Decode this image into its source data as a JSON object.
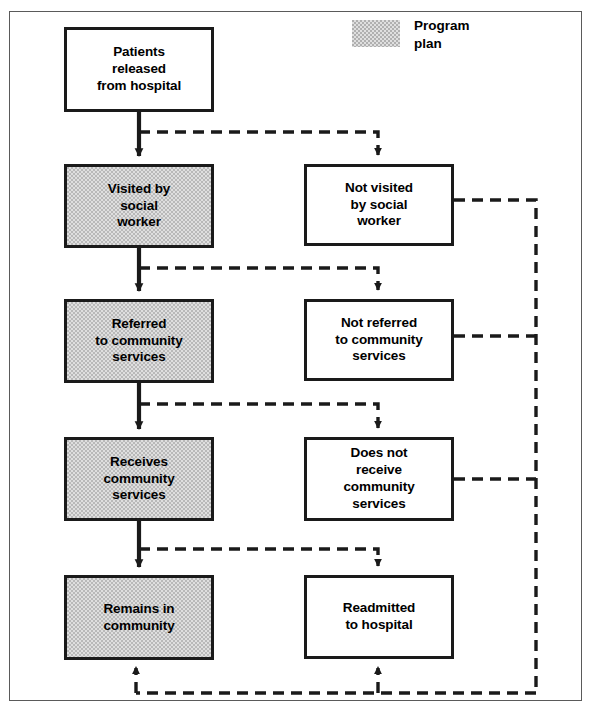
{
  "diagram": {
    "legend": {
      "swatch_name": "program-plan-swatch",
      "label": "Program\nplan",
      "fill_color": "#b0b0b0"
    },
    "colors": {
      "plan_fill": "#b9b9b9",
      "node_border": "#1a1a1a",
      "frame_border": "#5a5a5a",
      "solid_edge": "#1a1a1a",
      "dashed_edge": "#1a1a1a",
      "background": "#ffffff"
    },
    "nodes": [
      {
        "id": "patients-released",
        "label": "Patients\nreleased\nfrom hospital",
        "column": "start",
        "program_plan": false,
        "x": 64,
        "y": 27,
        "w": 150,
        "h": 85
      },
      {
        "id": "visited-social-worker",
        "label": "Visited by\nsocial\nworker",
        "column": "left",
        "program_plan": true,
        "x": 64,
        "y": 164,
        "w": 150,
        "h": 84
      },
      {
        "id": "not-visited-social-worker",
        "label": "Not visited\nby social\nworker",
        "column": "right",
        "program_plan": false,
        "x": 304,
        "y": 164,
        "w": 150,
        "h": 82
      },
      {
        "id": "referred-community-services",
        "label": "Referred\nto community\nservices",
        "column": "left",
        "program_plan": true,
        "x": 64,
        "y": 299,
        "w": 150,
        "h": 84
      },
      {
        "id": "not-referred-community-services",
        "label": "Not referred\nto community\nservices",
        "column": "right",
        "program_plan": false,
        "x": 304,
        "y": 299,
        "w": 150,
        "h": 82
      },
      {
        "id": "receives-community-services",
        "label": "Receives\ncommunity\nservices",
        "column": "left",
        "program_plan": true,
        "x": 64,
        "y": 437,
        "w": 150,
        "h": 84
      },
      {
        "id": "does-not-receive-community-services",
        "label": "Does not\nreceive\ncommunity\nservices",
        "column": "right",
        "program_plan": false,
        "x": 304,
        "y": 437,
        "w": 150,
        "h": 84
      },
      {
        "id": "remains-in-community",
        "label": "Remains in\ncommunity",
        "column": "left",
        "program_plan": true,
        "x": 64,
        "y": 575,
        "w": 150,
        "h": 85
      },
      {
        "id": "readmitted-to-hospital",
        "label": "Readmitted\nto hospital",
        "column": "right",
        "program_plan": false,
        "x": 304,
        "y": 575,
        "w": 150,
        "h": 84
      }
    ],
    "edges": [
      {
        "id": "edge-released-to-visited",
        "from": "patients-released",
        "to": "visited-social-worker",
        "style": "solid"
      },
      {
        "id": "edge-released-to-not-visited",
        "from": "patients-released",
        "to": "not-visited-social-worker",
        "style": "dashed"
      },
      {
        "id": "edge-visited-to-referred",
        "from": "visited-social-worker",
        "to": "referred-community-services",
        "style": "solid"
      },
      {
        "id": "edge-visited-to-not-referred",
        "from": "visited-social-worker",
        "to": "not-referred-community-services",
        "style": "dashed"
      },
      {
        "id": "edge-referred-to-receives",
        "from": "referred-community-services",
        "to": "receives-community-services",
        "style": "solid"
      },
      {
        "id": "edge-referred-to-not-receives",
        "from": "referred-community-services",
        "to": "does-not-receive-community-services",
        "style": "dashed"
      },
      {
        "id": "edge-receives-to-remains",
        "from": "receives-community-services",
        "to": "remains-in-community",
        "style": "solid"
      },
      {
        "id": "edge-receives-to-readmitted",
        "from": "receives-community-services",
        "to": "readmitted-to-hospital",
        "style": "dashed"
      },
      {
        "id": "edge-not-visited-to-bottom",
        "from": "not-visited-social-worker",
        "to": "remains-in-community",
        "style": "dashed"
      },
      {
        "id": "edge-not-referred-to-bottom",
        "from": "not-referred-community-services",
        "to": "remains-in-community",
        "style": "dashed"
      },
      {
        "id": "edge-not-receives-to-bottom",
        "from": "does-not-receive-community-services",
        "to": "readmitted-to-hospital",
        "style": "dashed"
      }
    ]
  }
}
